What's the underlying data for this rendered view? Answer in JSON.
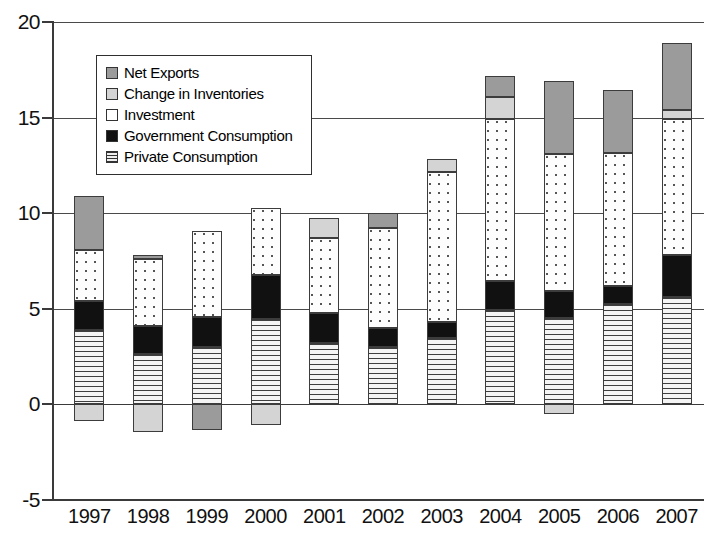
{
  "chart_data": {
    "type": "bar",
    "subtype": "stacked-bar",
    "title": "",
    "xlabel": "",
    "ylabel": "",
    "ylim": [
      -5,
      20
    ],
    "yticks": [
      -5,
      0,
      5,
      10,
      15,
      20
    ],
    "ytick_labels": [
      "-5",
      "0",
      "5",
      "10",
      "15",
      "20"
    ],
    "grid": true,
    "legend_position": "upper-left-inside",
    "categories": [
      "1997",
      "1998",
      "1999",
      "2000",
      "2001",
      "2002",
      "2003",
      "2004",
      "2005",
      "2006",
      "2007"
    ],
    "series": [
      {
        "name": "Private Consumption",
        "key": "private",
        "values": [
          3.9,
          2.65,
          3.0,
          4.45,
          3.2,
          3.0,
          3.45,
          4.95,
          4.5,
          5.25,
          5.6
        ]
      },
      {
        "name": "Government Consumption",
        "key": "government",
        "values": [
          1.5,
          1.45,
          1.55,
          2.3,
          1.6,
          1.0,
          0.85,
          1.5,
          1.45,
          0.95,
          2.2
        ]
      },
      {
        "name": "Investment",
        "key": "investment",
        "values": [
          2.7,
          3.5,
          4.5,
          3.5,
          3.9,
          5.25,
          7.85,
          8.5,
          7.15,
          6.95,
          7.15
        ]
      },
      {
        "name": "Change in Inventories",
        "key": "inventories",
        "values": [
          -0.85,
          -1.45,
          0.0,
          -1.1,
          1.05,
          0.0,
          0.7,
          1.15,
          -0.5,
          0.0,
          0.45
        ]
      },
      {
        "name": "Net Exports",
        "key": "net_exports",
        "values": [
          2.8,
          0.2,
          -1.35,
          0.0,
          0.0,
          0.75,
          0.0,
          1.1,
          3.8,
          3.3,
          3.5
        ]
      }
    ],
    "totals": [
      10.9,
      7.55,
      7.5,
      10.25,
      9.75,
      10.0,
      13.0,
      17.0,
      17.45,
      16.45,
      18.35
    ],
    "legend": [
      {
        "label": "Net Exports",
        "key": "net_exports",
        "color": "#9b9b9b",
        "pattern": "solid-gray"
      },
      {
        "label": "Change in Inventories",
        "key": "inventories",
        "color": "#d4d4d4",
        "pattern": "solid-light-gray"
      },
      {
        "label": "Investment",
        "key": "investment",
        "color": "#ffffff",
        "pattern": "dotted"
      },
      {
        "label": "Government Consumption",
        "key": "government",
        "color": "#111111",
        "pattern": "solid-black"
      },
      {
        "label": "Private Consumption",
        "key": "private",
        "color": "#eeeeee",
        "pattern": "horizontal-lines"
      }
    ],
    "colors": {
      "net_exports": "#9b9b9b",
      "inventories": "#d4d4d4",
      "investment": "#ffffff",
      "government": "#111111",
      "private": "#eeeeee",
      "axis": "#3a3a3a",
      "grid": "#4a4a4a"
    }
  }
}
